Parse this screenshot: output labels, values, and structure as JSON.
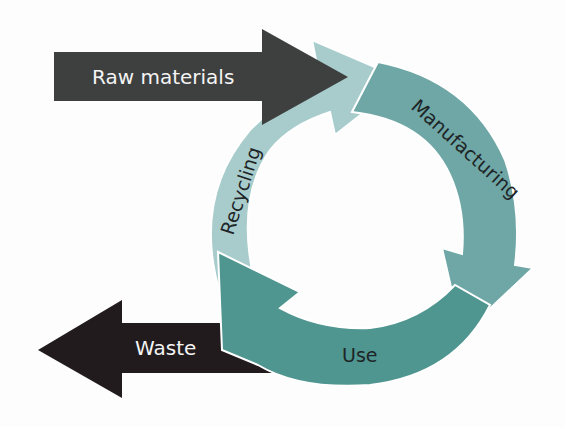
{
  "diagram": {
    "type": "cycle",
    "inputs": [
      {
        "label": "Raw materials",
        "direction": "into-cycle",
        "color": "#3e3f3f"
      }
    ],
    "outputs": [
      {
        "label": "Waste",
        "direction": "out-of-cycle",
        "color": "#211b1e"
      }
    ],
    "stages": [
      {
        "label": "Manufacturing",
        "color": "#6ea7a6"
      },
      {
        "label": "Use",
        "color": "#4f9590"
      },
      {
        "label": "Recycling",
        "color": "#a8cccc"
      }
    ]
  }
}
